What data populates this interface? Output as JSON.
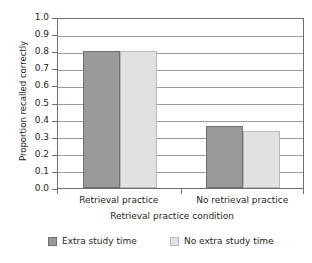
{
  "chart_data": {
    "type": "bar",
    "title": "",
    "xlabel": "Retrieval practice condition",
    "ylabel": "Proportion recalled correctly",
    "categories": [
      "Retrieval practice",
      "No retrieval practice"
    ],
    "series": [
      {
        "name": "Extra study time",
        "color": "#9a9a9a",
        "values": [
          0.8,
          0.36
        ]
      },
      {
        "name": "No extra study time",
        "color": "#e2e2e2",
        "values": [
          0.8,
          0.335
        ]
      }
    ],
    "ylim": [
      0.0,
      1.0
    ],
    "ytick_labels": [
      "1.0",
      "0.9",
      "0.8",
      "0.7",
      "0.6",
      "0.5",
      "0.4",
      "0.3",
      "0.2",
      "0.1",
      "0.0"
    ],
    "ytick_values": [
      1.0,
      0.9,
      0.8,
      0.7,
      0.6,
      0.5,
      0.4,
      0.3,
      0.2,
      0.1,
      0.0
    ],
    "grid": "horizontal",
    "legend_position": "bottom"
  }
}
